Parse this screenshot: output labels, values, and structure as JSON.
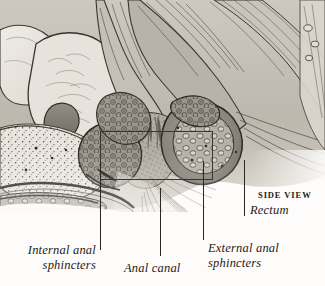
{
  "figure": {
    "view_label": "SIDE VIEW",
    "background_color": "#fdfcfa",
    "ink_color": "#1d1a17",
    "illustration_style": "grayscale sepia engraving"
  },
  "labels": {
    "internal_anal_sphincters": {
      "line1": "Internal anal",
      "line2": "sphincters"
    },
    "anal_canal": {
      "line1": "Anal canal"
    },
    "external_anal_sphincters": {
      "line1": "External anal",
      "line2": "sphincters"
    },
    "rectum": {
      "line1": "Rectum"
    }
  },
  "annotations": {
    "callout_box": {
      "x": 100,
      "y": 131,
      "width": 113,
      "height": 49,
      "color": "#3a352f"
    },
    "leader_lines": [
      {
        "name": "internal-anal-sphincters-leader",
        "x": 100,
        "y_top": 161,
        "y_bottom": 250
      },
      {
        "name": "anal-canal-leader",
        "x": 160,
        "y_top": 188,
        "y_bottom": 256
      },
      {
        "name": "external-anal-sphincters-leader",
        "x": 203,
        "y_top": 161,
        "y_bottom": 240
      },
      {
        "name": "rectum-leader",
        "x": 244,
        "y_top": 160,
        "y_bottom": 216
      }
    ]
  }
}
